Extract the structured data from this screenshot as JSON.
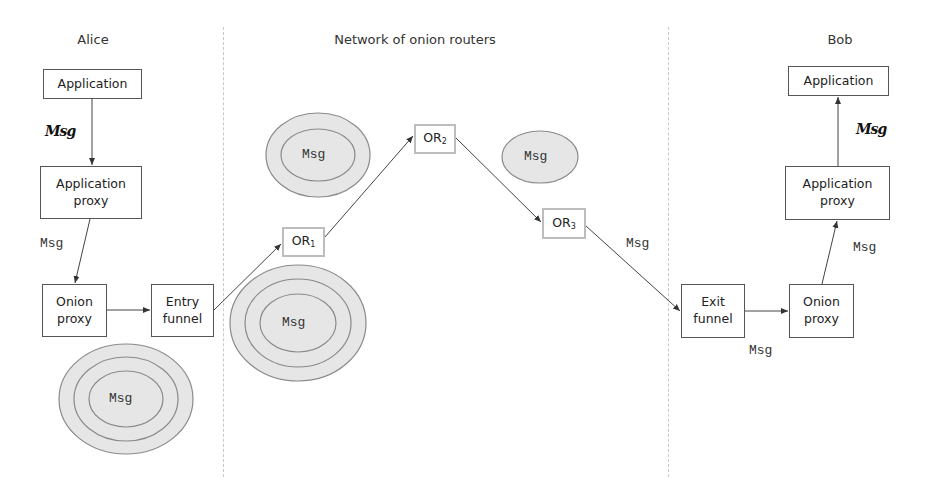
{
  "sections": {
    "alice": {
      "title": "Alice"
    },
    "network": {
      "title": "Network of onion routers"
    },
    "bob": {
      "title": "Bob"
    }
  },
  "alice": {
    "application": "Application",
    "application_proxy": [
      "Application",
      "proxy"
    ],
    "onion_proxy": [
      "Onion",
      "proxy"
    ],
    "entry_funnel": [
      "Entry",
      "funnel"
    ],
    "plain_msg_label": "Msg",
    "msg_label": "Msg",
    "onion": {
      "layers": 3,
      "label": "Msg"
    }
  },
  "network": {
    "routers": [
      {
        "label": "OR",
        "sub": "1",
        "onion": {
          "layers": 3,
          "label": "Msg"
        }
      },
      {
        "label": "OR",
        "sub": "2",
        "onion": {
          "layers": 2,
          "label": "Msg"
        }
      },
      {
        "label": "OR",
        "sub": "3",
        "onion": {
          "layers": 1,
          "label": "Msg"
        }
      }
    ],
    "or3_to_exit_label": "Msg"
  },
  "bob": {
    "application": "Application",
    "application_proxy": [
      "Application",
      "proxy"
    ],
    "onion_proxy": [
      "Onion",
      "proxy"
    ],
    "exit_funnel": [
      "Exit",
      "funnel"
    ],
    "plain_msg_label": "Msg",
    "proxy_msg_label": "Msg",
    "funnel_msg_label": "Msg"
  },
  "colors": {
    "onion_fill": "#e6e6e6",
    "onion_stroke": "#8a8a8a",
    "box_border": "#555555",
    "router_border": "#bdbdbd",
    "divider": "#c8c8c8"
  }
}
